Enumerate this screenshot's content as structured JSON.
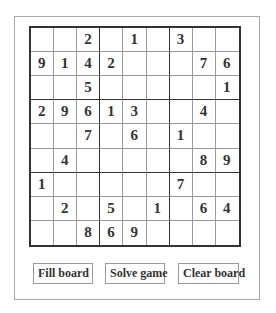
{
  "board": [
    [
      "",
      "",
      "2",
      "",
      "1",
      "",
      "3",
      "",
      ""
    ],
    [
      "9",
      "1",
      "4",
      "2",
      "",
      "",
      "",
      "7",
      "6"
    ],
    [
      "",
      "",
      "5",
      "",
      "",
      "",
      "",
      "",
      "1"
    ],
    [
      "2",
      "9",
      "6",
      "1",
      "3",
      "",
      "",
      "4",
      ""
    ],
    [
      "",
      "",
      "7",
      "",
      "6",
      "",
      "1",
      "",
      ""
    ],
    [
      "",
      "4",
      "",
      "",
      "",
      "",
      "",
      "8",
      "9"
    ],
    [
      "1",
      "",
      "",
      "",
      "",
      "",
      "7",
      "",
      ""
    ],
    [
      "",
      "2",
      "",
      "5",
      "",
      "1",
      "",
      "6",
      "4"
    ],
    [
      "",
      "",
      "8",
      "6",
      "9",
      "",
      "",
      "",
      ""
    ]
  ],
  "buttons": {
    "fill": "Fill board",
    "solve": "Solve game",
    "clear": "Clear board"
  }
}
